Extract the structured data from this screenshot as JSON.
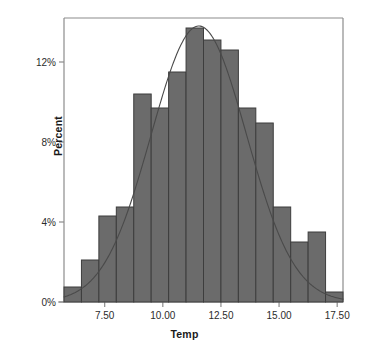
{
  "chart_data": {
    "type": "bar",
    "title": "",
    "subtitle": "",
    "xlabel": "Temp",
    "ylabel": "Percent",
    "xlim": [
      5.75,
      17.75
    ],
    "ylim": [
      0,
      14.2
    ],
    "grid": false,
    "legend": null,
    "bin_width": 0.75,
    "categories": [
      "5.75-6.50",
      "6.50-7.25",
      "7.25-8.00",
      "8.00-8.75",
      "8.75-9.50",
      "9.50-10.25",
      "10.25-11.00",
      "11.00-11.75",
      "11.75-12.50",
      "12.50-13.25",
      "13.25-14.00",
      "14.00-14.75",
      "14.75-15.50",
      "15.50-16.25",
      "16.25-17.00",
      "17.00-17.75"
    ],
    "bin_starts": [
      5.75,
      6.5,
      7.25,
      8.0,
      8.75,
      9.5,
      10.25,
      11.0,
      11.75,
      12.5,
      13.25,
      14.0,
      14.75,
      15.5,
      16.25,
      17.0
    ],
    "bin_ends": [
      6.5,
      7.25,
      8.0,
      8.75,
      9.5,
      10.25,
      11.0,
      11.75,
      12.5,
      13.25,
      14.0,
      14.75,
      15.5,
      16.25,
      17.0,
      17.75
    ],
    "values": [
      0.75,
      2.1,
      4.3,
      4.75,
      10.4,
      9.7,
      11.5,
      13.7,
      13.1,
      12.6,
      9.7,
      8.95,
      4.75,
      3.0,
      3.5,
      0.5
    ],
    "yticks": [
      0,
      4,
      8,
      12
    ],
    "ytick_labels": [
      "0%",
      "4%",
      "8%",
      "12%"
    ],
    "xticks": [
      7.5,
      10.0,
      12.5,
      15.0,
      17.5
    ],
    "xtick_labels": [
      "7.50",
      "10.00",
      "12.50",
      "15.00",
      "17.50"
    ],
    "overlay_curve": {
      "name": "normal-density-curve",
      "type": "line",
      "mean": 11.55,
      "stdev": 2.05,
      "peak_percent": 13.8
    },
    "colors": {
      "bar_fill": "#6b6b6b",
      "bar_border": "#3d3d3d",
      "curve": "#4a4a4a",
      "axis": "#8c8c8c",
      "text": "#1a1a1a",
      "background": "#ffffff"
    }
  },
  "plot_box": {
    "left": 64,
    "right": 343,
    "top": 18,
    "bottom": 302
  }
}
